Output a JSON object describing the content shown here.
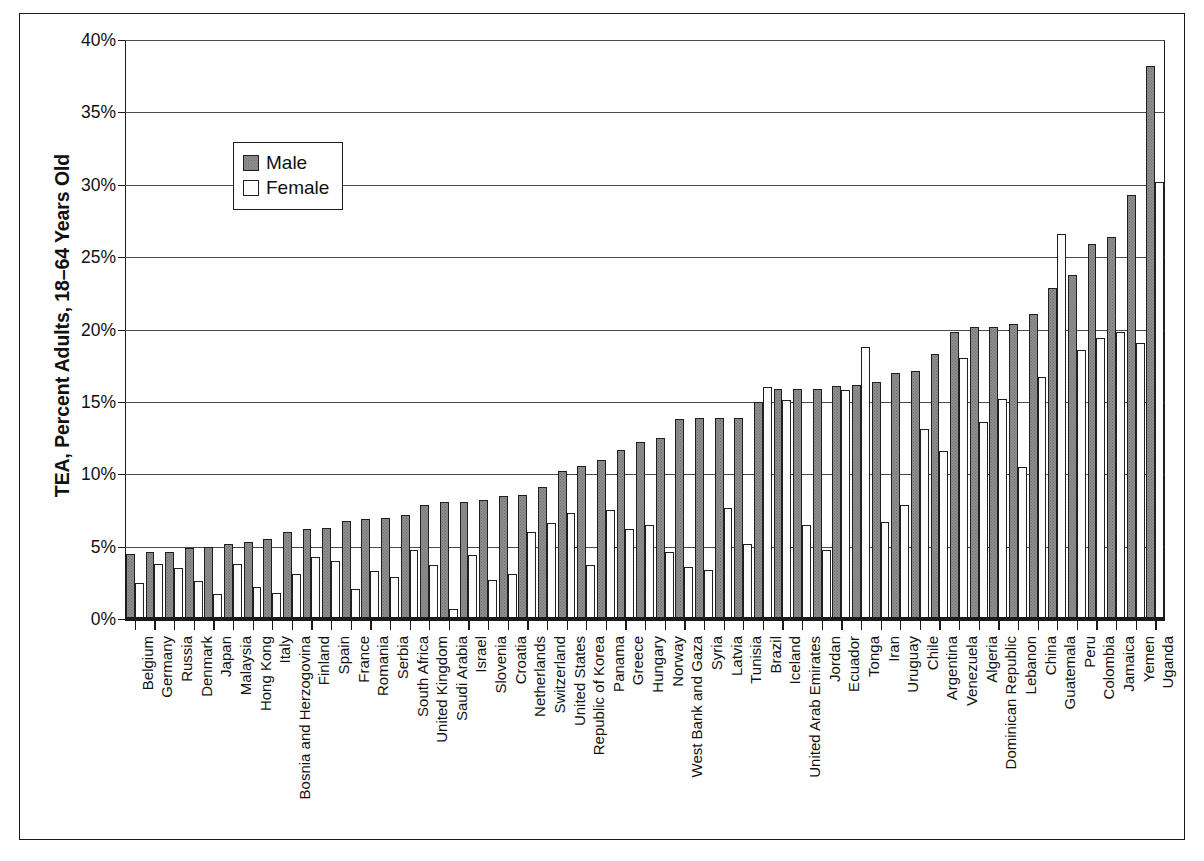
{
  "chart_data": {
    "type": "bar",
    "title": "",
    "subtitle": "",
    "xlabel": "",
    "ylabel": "TEA, Percent Adults, 18–64 Years Old",
    "ylim": [
      0,
      40
    ],
    "ytick_values": [
      0,
      5,
      10,
      15,
      20,
      25,
      30,
      35,
      40
    ],
    "ytick_labels": [
      "0%",
      "5%",
      "10%",
      "15%",
      "20%",
      "25%",
      "30%",
      "35%",
      "40%"
    ],
    "grid": true,
    "legend_position": "upper-left-inside",
    "orientation": "vertical",
    "grouping": "grouped",
    "categories": [
      "Belgium",
      "Germany",
      "Russia",
      "Denmark",
      "Japan",
      "Malaysia",
      "Hong Kong",
      "Italy",
      "Bosnia and Herzogovina",
      "Finland",
      "Spain",
      "France",
      "Romania",
      "Serbia",
      "South Africa",
      "United Kingdom",
      "Saudi Arabia",
      "Israel",
      "Slovenia",
      "Croatia",
      "Netherlands",
      "Switzerland",
      "United States",
      "Republic of Korea",
      "Panama",
      "Greece",
      "Hungary",
      "Norway",
      "West Bank and Gaza",
      "Syria",
      "Latvia",
      "Tunisia",
      "Brazil",
      "Iceland",
      "United Arab Emirates",
      "Jordan",
      "Ecuador",
      "Tonga",
      "Iran",
      "Uruguay",
      "Chile",
      "Argentina",
      "Venezuela",
      "Algeria",
      "Dominican Republic",
      "Lebanon",
      "China",
      "Guatemala",
      "Peru",
      "Colombia",
      "Jamaica",
      "Yemen",
      "Uganda"
    ],
    "series": [
      {
        "name": "Male",
        "color": "#8e8e8e",
        "values": [
          4.5,
          4.6,
          4.6,
          4.9,
          5.0,
          5.2,
          5.3,
          5.5,
          6.0,
          6.2,
          6.3,
          6.8,
          6.9,
          7.0,
          7.2,
          7.9,
          8.1,
          8.1,
          8.2,
          8.5,
          8.6,
          9.1,
          10.2,
          10.6,
          11.0,
          11.7,
          12.2,
          12.5,
          13.8,
          13.9,
          13.9,
          13.9,
          15.0,
          15.9,
          15.9,
          15.9,
          16.1,
          16.2,
          16.4,
          17.0,
          17.1,
          18.3,
          19.8,
          20.2,
          20.2,
          20.4,
          21.1,
          22.9,
          23.8,
          25.9,
          26.4,
          29.3,
          38.2
        ]
      },
      {
        "name": "Female",
        "color": "#fbfbfb",
        "values": [
          2.5,
          3.8,
          3.5,
          2.6,
          1.7,
          3.8,
          2.2,
          1.8,
          3.1,
          4.3,
          4.0,
          2.1,
          3.3,
          2.9,
          4.8,
          3.7,
          0.7,
          4.4,
          2.7,
          3.1,
          6.0,
          6.6,
          7.3,
          3.7,
          7.5,
          6.2,
          6.5,
          4.6,
          3.6,
          3.4,
          7.7,
          5.2,
          16.0,
          15.1,
          6.5,
          4.8,
          15.8,
          18.8,
          6.7,
          7.9,
          13.1,
          11.6,
          18.0,
          13.6,
          15.2,
          10.5,
          16.7,
          26.6,
          18.6,
          19.4,
          19.8,
          19.1,
          30.2
        ]
      }
    ]
  },
  "legend": {
    "items": [
      {
        "label": "Male"
      },
      {
        "label": "Female"
      }
    ]
  }
}
